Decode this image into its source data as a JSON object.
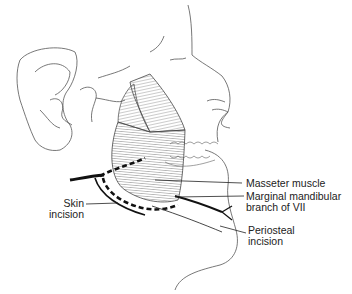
{
  "figure": {
    "labels": {
      "masseter": "Masseter muscle",
      "marginal_line1": "Marginal mandibular",
      "marginal_line2": "branch of VII",
      "periosteal_line1": "Periosteal",
      "periosteal_line2": "incision",
      "skin_line1": "Skin",
      "skin_line2": "incision"
    }
  }
}
